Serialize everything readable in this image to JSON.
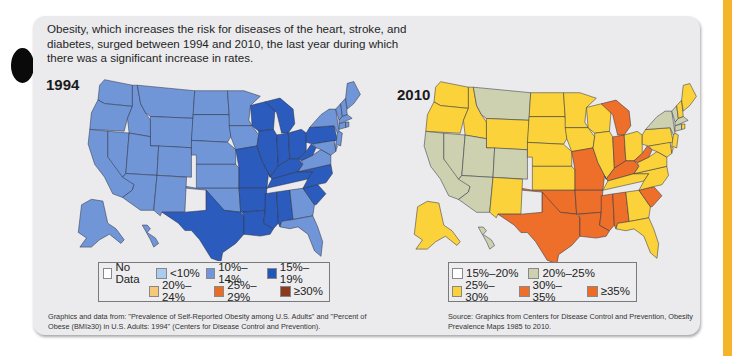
{
  "intro_text": "Obesity, which increases the risk for diseases of the heart, stroke, and diabetes, surged between 1994 and 2010, the last year during which there was a significant increase in rates.",
  "maps": [
    {
      "year": "1994",
      "legend": {
        "rows": [
          [
            {
              "label": "No Data",
              "color": "#ffffff"
            },
            {
              "label": "<10%",
              "color": "#a9cdee"
            },
            {
              "label": "10%–14%",
              "color": "#6f95da"
            },
            {
              "label": "15%–19%",
              "color": "#1f56b8"
            }
          ],
          [
            {
              "label": "20%–24%",
              "color": "#f5c977"
            },
            {
              "label": "25%–29%",
              "color": "#ea6b24"
            },
            {
              "label": "≥30%",
              "color": "#8c3b1f"
            }
          ]
        ]
      },
      "credit": "Graphics and data from: \"Prevalence of Self-Reported Obesity among U.S. Adults\" and \"Percent of Obese (BMI≥30) in U.S. Adults: 1994\" (Centers for Disease Control and Prevention)."
    },
    {
      "year": "2010",
      "legend": {
        "rows": [
          [
            {
              "label": "15%–20%",
              "color": "#ffffff"
            },
            {
              "label": "20%–25%",
              "color": "#cdd1b0"
            }
          ],
          [
            {
              "label": "25%–30%",
              "color": "#fbd23a"
            },
            {
              "label": "30%–35%",
              "color": "#ed6f2a"
            },
            {
              "label": "≥35%",
              "color": "#ee6a25"
            }
          ]
        ]
      },
      "credit": "Source: Graphics from Centers for Disease Control and Prevention, Obesity Prevalence Maps 1985 to 2010."
    }
  ],
  "chart_data": [
    {
      "type": "heatmap",
      "title": "1994",
      "subtype": "choropleth",
      "legend": [
        "No Data",
        "<10%",
        "10%–14%",
        "15%–19%",
        "20%–24%",
        "25%–29%",
        "≥30%"
      ],
      "values": {
        "15%–19%": [
          "TX",
          "LA",
          "MS",
          "AL",
          "AR",
          "MO",
          "IL",
          "IN",
          "OH",
          "MI",
          "WI",
          "KY",
          "WV",
          "PA",
          "TN",
          "NC",
          "SC"
        ],
        "10%–14%": [
          "WA",
          "OR",
          "CA",
          "NV",
          "ID",
          "MT",
          "WY",
          "UT",
          "CO",
          "AZ",
          "NM",
          "ND",
          "SD",
          "NE",
          "KS",
          "OK",
          "MN",
          "IA",
          "GA",
          "FL",
          "VA",
          "NY",
          "ME",
          "VT",
          "NH",
          "MA",
          "CT",
          "RI",
          "NJ",
          "DE",
          "MD",
          "AK",
          "HI"
        ]
      }
    },
    {
      "type": "heatmap",
      "title": "2010",
      "subtype": "choropleth",
      "legend": [
        "15%–20%",
        "20%–25%",
        "25%–30%",
        "30%–35%",
        "≥35%"
      ],
      "values": {
        "20%–25%": [
          "CA",
          "NV",
          "UT",
          "CO",
          "AZ",
          "MT",
          "NY",
          "VT",
          "MA",
          "CT",
          "HI"
        ],
        "25%–30%": [
          "WA",
          "OR",
          "ID",
          "WY",
          "NM",
          "ND",
          "SD",
          "NE",
          "KS",
          "MN",
          "IA",
          "WI",
          "IL",
          "OH",
          "PA",
          "VA",
          "NC",
          "TN",
          "GA",
          "FL",
          "ME",
          "NH",
          "RI",
          "NJ",
          "DE",
          "MD",
          "AK"
        ],
        "30%–35%": [
          "TX",
          "OK",
          "MO",
          "AR",
          "LA",
          "MS",
          "AL",
          "MI",
          "IN",
          "KY",
          "WV",
          "SC"
        ]
      }
    }
  ]
}
